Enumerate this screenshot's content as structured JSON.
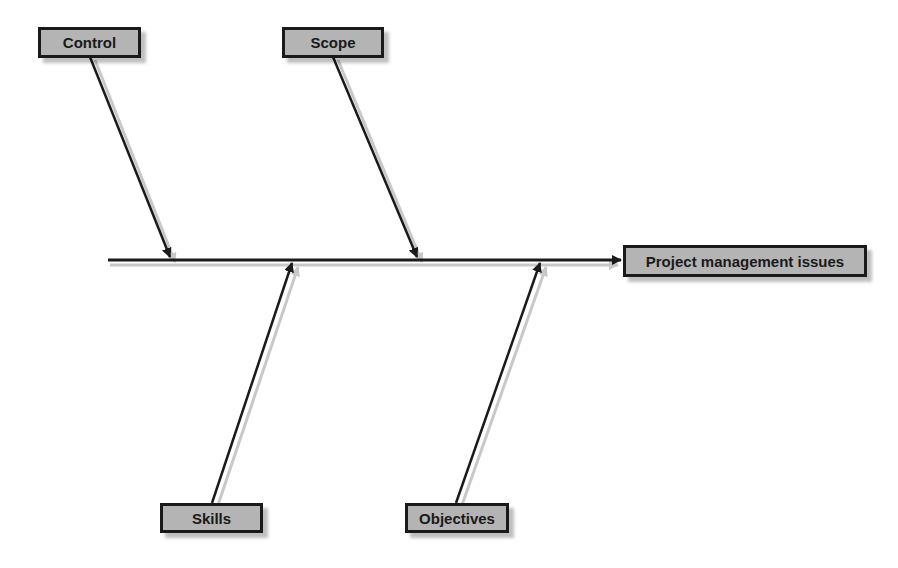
{
  "diagram": {
    "type": "fishbone",
    "effect": {
      "label": "Project management issues"
    },
    "causes": [
      {
        "label": "Control",
        "position": "top"
      },
      {
        "label": "Scope",
        "position": "top"
      },
      {
        "label": "Skills",
        "position": "bottom"
      },
      {
        "label": "Objectives",
        "position": "bottom"
      }
    ],
    "colors": {
      "box_fill": "#b4b4b4",
      "line": "#1a1a1a",
      "background": "#ffffff"
    }
  }
}
